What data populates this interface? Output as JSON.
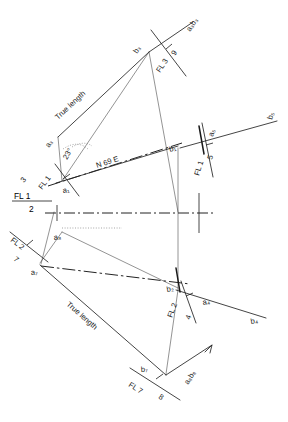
{
  "drawing": {
    "title": "Descriptive geometry fold-line construction",
    "background_color": "#ffffff",
    "ink_color": "#232323",
    "width": 288,
    "height": 422
  },
  "annotations": {
    "true_length_upper": "True length",
    "true_length_lower": "True length",
    "bearing": "N 69 E",
    "angle": "23°"
  },
  "fold_lines": [
    {
      "id": "fl-1-2",
      "upper": "FL 1",
      "lower": "2"
    },
    {
      "id": "fl-1-3",
      "upper": "FL 1",
      "lower": "3"
    },
    {
      "id": "fl-3-9",
      "upper": "FL 3",
      "lower": "9"
    },
    {
      "id": "fl-1-5",
      "upper": "FL 1",
      "lower": "5"
    },
    {
      "id": "fl-2-7",
      "upper": "FL 2",
      "lower": "7"
    },
    {
      "id": "fl-2-4",
      "upper": "FL 2",
      "lower": "4"
    },
    {
      "id": "fl-7-8",
      "upper": "FL 7",
      "lower": "8"
    }
  ],
  "points": {
    "a1": "a₁",
    "a3": "a₃",
    "a4": "a₄",
    "a5": "a₅",
    "a7": "a₇",
    "a8": "a₈",
    "b1": "b₁",
    "b2": "b₂",
    "b3": "b₃",
    "b4": "b₄",
    "b5": "b₅",
    "b7": "b₇",
    "a3b3": "a₃b₃",
    "a8b8": "a₈b₈"
  }
}
